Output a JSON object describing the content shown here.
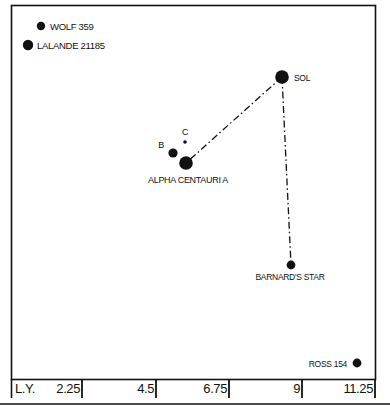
{
  "diagram": {
    "stars": [
      {
        "id": "wolf-359",
        "name": "WOLF 359",
        "size": "small",
        "label_side": "right"
      },
      {
        "id": "lalande-21185",
        "name": "LALANDE 21185",
        "size": "medium",
        "label_side": "right"
      },
      {
        "id": "sol",
        "name": "SOL",
        "size": "large",
        "label_side": "right"
      },
      {
        "id": "alpha-centauri-a",
        "name": "ALPHA CENTAURI A",
        "size": "large",
        "label_side": "below"
      },
      {
        "id": "alpha-centauri-b",
        "name": "B",
        "size": "medium",
        "label_side": "left"
      },
      {
        "id": "alpha-centauri-c",
        "name": "C",
        "size": "tiny",
        "label_side": "above"
      },
      {
        "id": "barnards-star",
        "name": "BARNARD'S STAR",
        "size": "medium",
        "label_side": "below"
      },
      {
        "id": "ross-154",
        "name": "ROSS 154",
        "size": "medium",
        "label_side": "left"
      }
    ],
    "routes": [
      {
        "from": "sol",
        "to": "alpha-centauri-a",
        "style": "dash-dot"
      },
      {
        "from": "sol",
        "to": "barnards-star",
        "style": "dash-dot"
      }
    ],
    "scale": {
      "unit_label": "L.Y.",
      "ticks": [
        "2.25",
        "4.5",
        "6.75",
        "9",
        "11.25"
      ]
    },
    "colors": {
      "ink": "#111111",
      "background": "#ffffff"
    }
  }
}
